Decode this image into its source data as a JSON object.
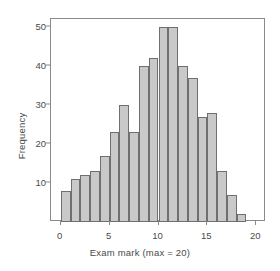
{
  "chart_data": {
    "type": "bar",
    "title": "",
    "subtitle": "",
    "xlabel": "Exam mark (max = 20)",
    "ylabel": "Frequency",
    "categories": [
      "0",
      "1",
      "2",
      "3",
      "4",
      "5",
      "6",
      "7",
      "8",
      "9",
      "10",
      "11",
      "12",
      "13",
      "14",
      "15",
      "16",
      "17",
      "18"
    ],
    "bin_starts": [
      0,
      1,
      2,
      3,
      4,
      5,
      6,
      7,
      8,
      9,
      10,
      11,
      12,
      13,
      14,
      15,
      16,
      17,
      18
    ],
    "bin_width": 1,
    "values": [
      8,
      11,
      12,
      13,
      17,
      23,
      30,
      23,
      40,
      42,
      50,
      50,
      40,
      37,
      27,
      28,
      13,
      7,
      2
    ],
    "xlim": [
      -1,
      21
    ],
    "ylim": [
      0,
      52
    ],
    "xticks": [
      0,
      5,
      10,
      15,
      20
    ],
    "xtick_labels": [
      "0",
      "5",
      "10",
      "15",
      "20"
    ],
    "yticks": [
      10,
      20,
      30,
      40,
      50
    ],
    "ytick_labels": [
      "10",
      "20",
      "30",
      "40",
      "50"
    ],
    "grid": false,
    "legend": false,
    "legend_position": "none",
    "bar_fill_color": "#c9c9c9",
    "bar_border_color": "#6f6f6f",
    "frame_color": "#8a8a8a",
    "text_color": "#4a4a4a",
    "background_color": "#ffffff"
  }
}
